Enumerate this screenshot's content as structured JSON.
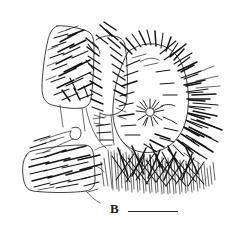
{
  "figure": {
    "panel_label": "B",
    "label_color": "#1a1a1a",
    "background_color": "#ffffff",
    "ink_color": "#141414",
    "type": "scientific-line-drawing",
    "scale_bar": {
      "present": true,
      "length_px": 50,
      "thickness_px": 1.6,
      "color": "#2b2b2b",
      "caption": ""
    },
    "structures": [
      {
        "name": "proximal-podomere-upper",
        "description": "rounded rectangular segment, upper left, bearing oblique setae"
      },
      {
        "name": "proximal-podomere-lower",
        "description": "rounded rectangular segment, lower left, bearing oblique setae"
      },
      {
        "name": "median-podomere",
        "description": "elongate central segment with marginal setal row"
      },
      {
        "name": "distal-podomere",
        "description": "broad distal segment densely fringed with long setae"
      },
      {
        "name": "sensory-rosette",
        "description": "stellate sensory organ near centre of distal segment"
      },
      {
        "name": "hook-process",
        "description": "small elongate loop process at left margin"
      },
      {
        "name": "setal-brush",
        "description": "dense ventral brush of fine setae along lower margin"
      }
    ]
  }
}
